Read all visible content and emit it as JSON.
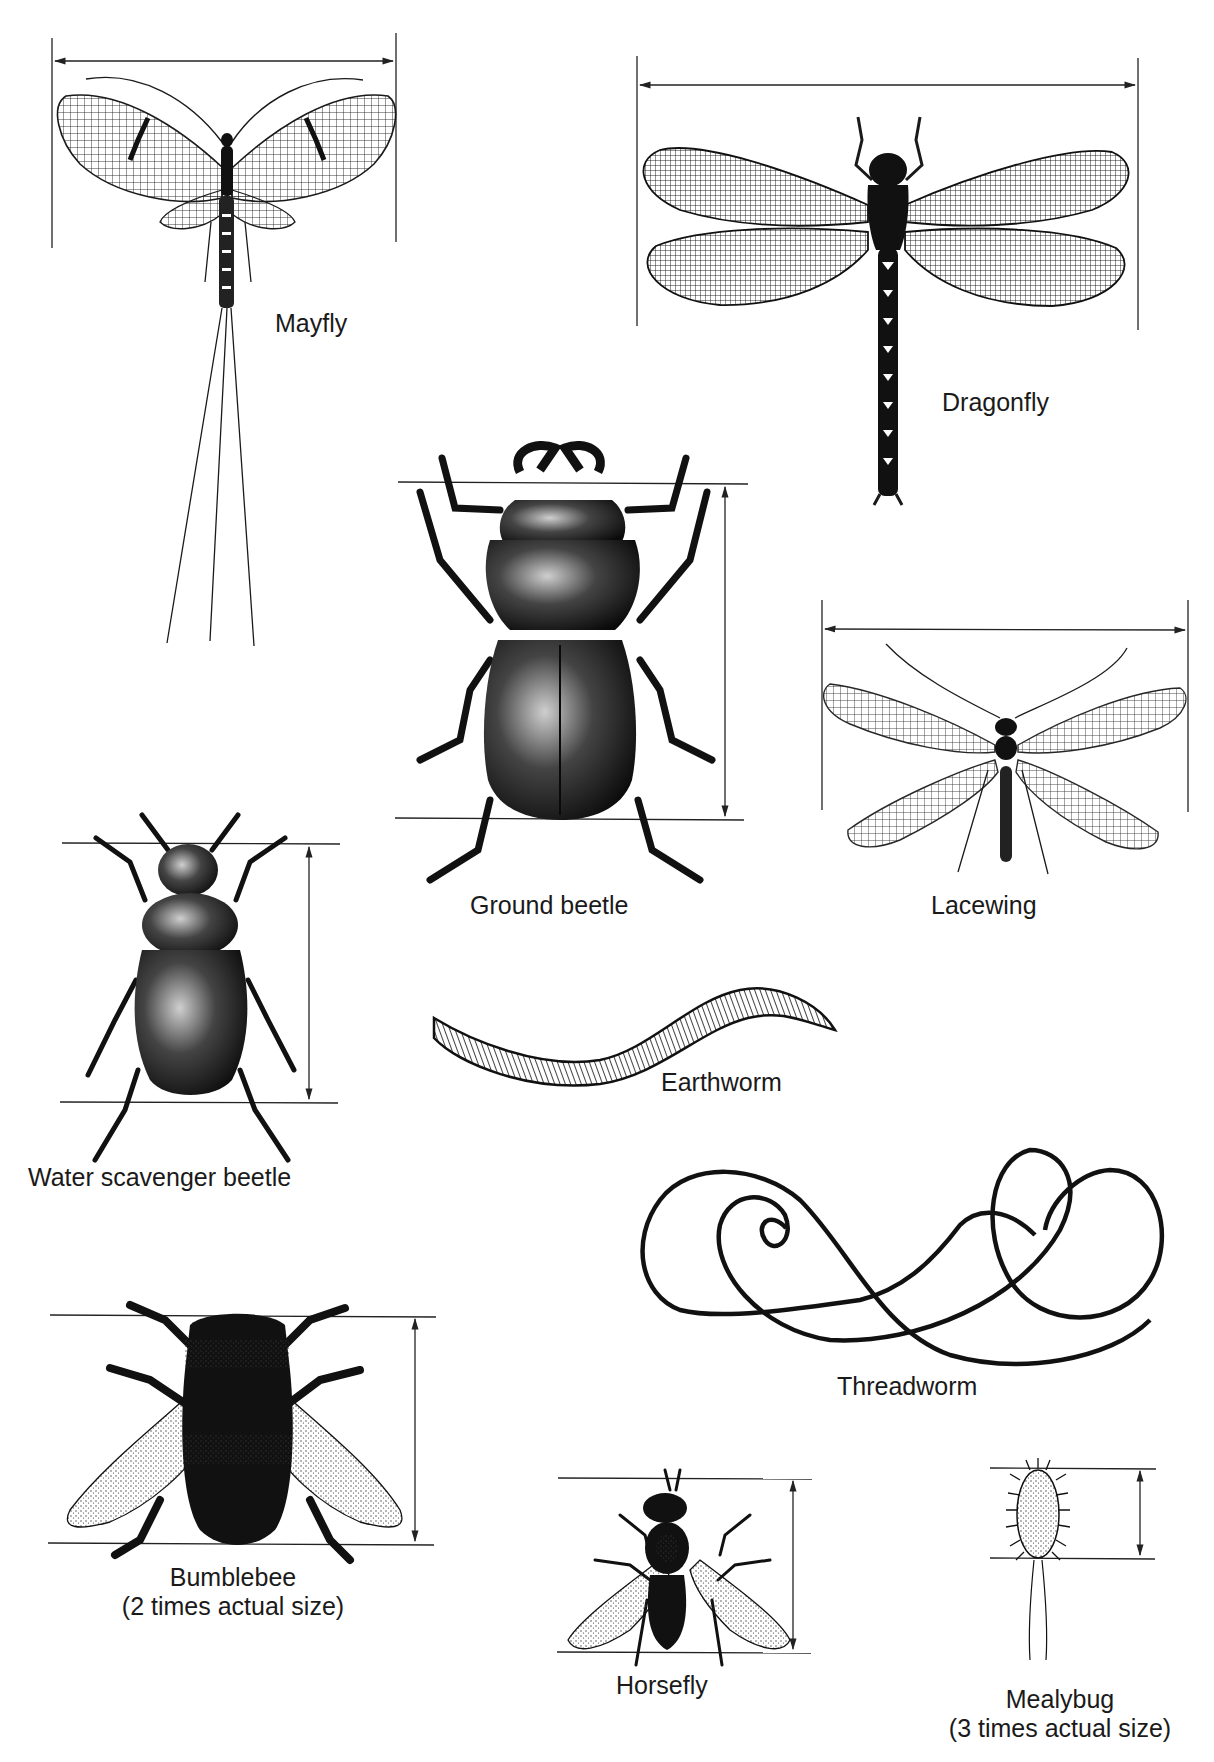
{
  "figure": {
    "ink_color": "#1a1a1a",
    "background": "#ffffff"
  },
  "specimens": [
    {
      "id": "mayfly",
      "label": "Mayfly",
      "note": "",
      "measure": "wingspan"
    },
    {
      "id": "dragonfly",
      "label": "Dragonfly",
      "note": "",
      "measure": "wingspan"
    },
    {
      "id": "ground-beetle",
      "label": "Ground beetle",
      "note": "",
      "measure": "body-length"
    },
    {
      "id": "lacewing",
      "label": "Lacewing",
      "note": "",
      "measure": "wingspan"
    },
    {
      "id": "water-scavenger-beetle",
      "label": "Water scavenger beetle",
      "note": "",
      "measure": "body-length"
    },
    {
      "id": "earthworm",
      "label": "Earthworm",
      "note": "",
      "measure": ""
    },
    {
      "id": "threadworm",
      "label": "Threadworm",
      "note": "",
      "measure": ""
    },
    {
      "id": "bumblebee",
      "label": "Bumblebee",
      "note": "(2 times actual size)",
      "measure": "body-length"
    },
    {
      "id": "horsefly",
      "label": "Horsefly",
      "note": "",
      "measure": "body-length"
    },
    {
      "id": "mealybug",
      "label": "Mealybug",
      "note": "(3 times actual size)",
      "measure": "body-length"
    }
  ]
}
